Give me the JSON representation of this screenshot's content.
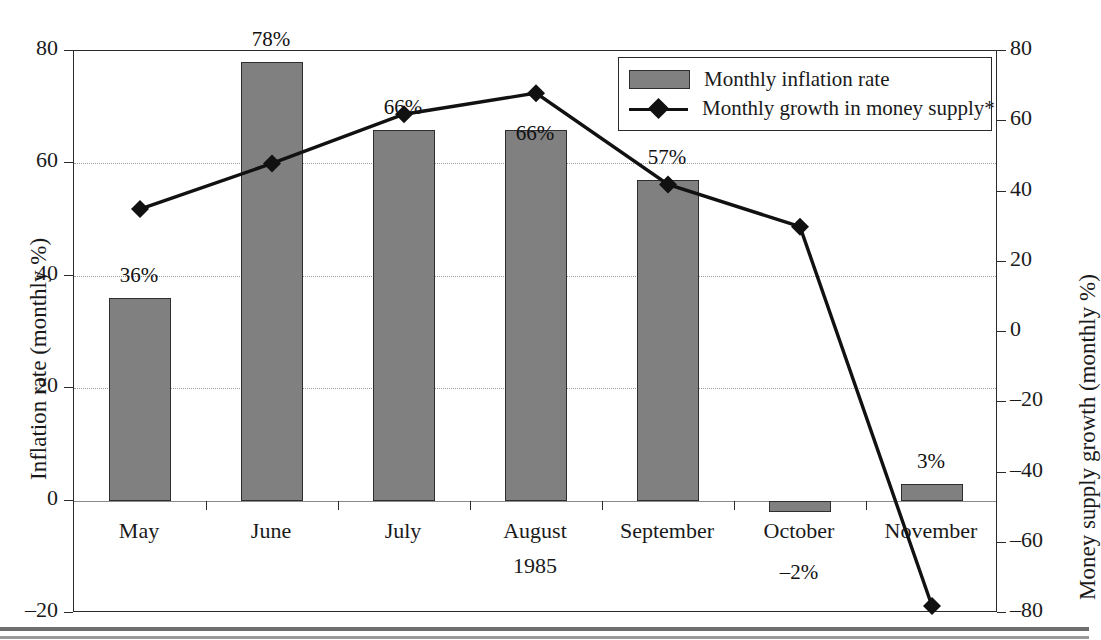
{
  "chart_data": {
    "type": "bar",
    "title": "",
    "categories": [
      "May",
      "June",
      "July",
      "August",
      "September",
      "October",
      "November"
    ],
    "xlabel": "1985",
    "ylabel": "Inflation rate (monthly %)",
    "y2label": "Money supply growth (monthly %)",
    "ylim": [
      -20,
      80
    ],
    "yticks": [
      "80",
      "60",
      "40",
      "20",
      "0",
      "-20"
    ],
    "y2lim": [
      -80,
      80
    ],
    "y2ticks": [
      "80",
      "60",
      "40",
      "20",
      "0",
      "-20",
      "-40",
      "-60",
      "-80"
    ],
    "grid": true,
    "legend_position": "top-right",
    "series": [
      {
        "name": "Monthly inflation rate",
        "kind": "bar",
        "axis": "left",
        "color": "#808080",
        "values": [
          36,
          78,
          66,
          66,
          57,
          -2,
          3
        ],
        "labels": [
          "36%",
          "78%",
          "66%",
          "66%",
          "57%",
          "-2%",
          "3%"
        ]
      },
      {
        "name": "Monthly growth in money supply*",
        "kind": "line",
        "axis": "right",
        "color": "#111111",
        "values": [
          35,
          48,
          62,
          68,
          42,
          30,
          -78
        ],
        "labels": [
          "",
          "",
          "",
          "",
          "",
          "",
          ""
        ]
      }
    ]
  },
  "axes": {
    "left_title": "Inflation rate (monthly %)",
    "right_title": "Money supply growth (monthly %)",
    "x_group_label": "1985"
  },
  "left_ticks": [
    {
      "label": "80",
      "value": 80
    },
    {
      "label": "60",
      "value": 60
    },
    {
      "label": "40",
      "value": 40
    },
    {
      "label": "20",
      "value": 20
    },
    {
      "label": "0",
      "value": 0
    },
    {
      "label": "–20",
      "value": -20
    }
  ],
  "right_ticks": [
    {
      "label": "80",
      "value": 80
    },
    {
      "label": "60",
      "value": 60
    },
    {
      "label": "40",
      "value": 40
    },
    {
      "label": "20",
      "value": 20
    },
    {
      "label": "0",
      "value": 0
    },
    {
      "label": "–20",
      "value": -20
    },
    {
      "label": "–40",
      "value": -40
    },
    {
      "label": "–60",
      "value": -60
    },
    {
      "label": "–80",
      "value": -80
    }
  ],
  "months": [
    "May",
    "June",
    "July",
    "August",
    "September",
    "October",
    "November"
  ],
  "bar_labels": {
    "may": "36%",
    "june": "78%",
    "july": "66%",
    "august": "66%",
    "september": "57%",
    "october": "–2%",
    "november": "3%"
  },
  "legend": {
    "bars_label": "Monthly inflation rate",
    "line_label": "Monthly growth in money supply*"
  },
  "colors": {
    "bar_fill": "#808080",
    "bar_stroke": "#2e2e2e",
    "line": "#111111",
    "axis": "#2a2a2a",
    "grid": "#9a9a9a"
  }
}
